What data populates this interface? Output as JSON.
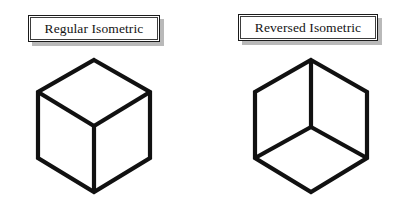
{
  "figure": {
    "background_color": "#ffffff",
    "line_color": "#111111",
    "shadow_color": "#b9b9b9",
    "panels": [
      {
        "id": "regular",
        "label": "Regular Isometric",
        "cube": {
          "name": "regular-isometric-cube",
          "description": "Isometric cube viewed from above; top face visible, Y-junction at center pointing down",
          "visible_faces": [
            "top",
            "left",
            "right"
          ],
          "outline_points": "94,10 150,42 150,108 94,142 38,108 38,42",
          "spoke_center": "94,76",
          "spoke_top": "94,10",
          "spoke_left": "38,42",
          "spoke_right": "150,42"
        }
      },
      {
        "id": "reversed",
        "label": "Reversed Isometric",
        "cube": {
          "name": "reversed-isometric-cube",
          "description": "Isometric cube viewed from below; bottom face visible, inverted Y-junction at center pointing up",
          "visible_faces": [
            "bottom",
            "left",
            "right"
          ],
          "outline_points": "107,10 163,42 163,108 107,142 51,108 51,42",
          "spoke_center": "107,77",
          "spoke_up": "107,10",
          "spoke_left": "51,108",
          "spoke_right": "163,108"
        }
      }
    ]
  }
}
